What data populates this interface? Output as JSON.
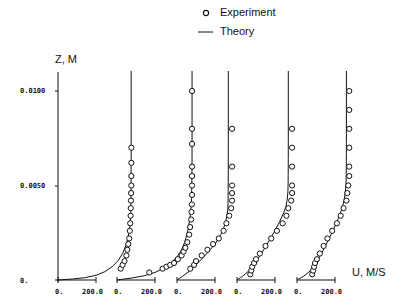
{
  "legend": {
    "experiment_label": "Experiment",
    "theory_label": "Theory"
  },
  "axes": {
    "y_label": "Z, M",
    "x_label": "U, M/S",
    "y_ticks": [
      "0.0100",
      "0.0050",
      "0."
    ],
    "x_tick_labels": [
      "0.",
      "200.0"
    ]
  },
  "chart_data": {
    "type": "line",
    "title": "",
    "xlabel": "U, M/S",
    "ylabel": "Z, M",
    "ylim": [
      0,
      0.01
    ],
    "y_ticks": [
      0,
      0.005,
      0.01
    ],
    "x_ticks_per_panel": [
      0,
      200
    ],
    "legend": [
      "Experiment (circles)",
      "Theory (line)"
    ],
    "grid": false,
    "panels": [
      {
        "name": "profile-1",
        "freestream_U": 385,
        "theory": [
          [
            0,
            0
          ],
          [
            150,
            0.0001
          ],
          [
            250,
            0.0004
          ],
          [
            320,
            0.001
          ],
          [
            360,
            0.0018
          ],
          [
            380,
            0.0028
          ],
          [
            385,
            0.004
          ],
          [
            385,
            0.01
          ]
        ],
        "experiment": [
          [
            330,
            0.0006
          ],
          [
            340,
            0.0008
          ],
          [
            350,
            0.001
          ],
          [
            360,
            0.0013
          ],
          [
            365,
            0.0016
          ],
          [
            370,
            0.0019
          ],
          [
            375,
            0.0022
          ],
          [
            378,
            0.0026
          ],
          [
            380,
            0.003
          ],
          [
            382,
            0.0034
          ],
          [
            383,
            0.0038
          ],
          [
            384,
            0.0042
          ],
          [
            385,
            0.0046
          ],
          [
            386,
            0.005
          ],
          [
            386,
            0.0055
          ],
          [
            386,
            0.0062
          ],
          [
            386,
            0.007
          ]
        ]
      },
      {
        "name": "profile-2",
        "freestream_U": 395,
        "theory": [
          [
            0,
            0
          ],
          [
            150,
            0.0002
          ],
          [
            250,
            0.0006
          ],
          [
            320,
            0.0012
          ],
          [
            360,
            0.002
          ],
          [
            385,
            0.0032
          ],
          [
            395,
            0.0045
          ],
          [
            395,
            0.01
          ]
        ],
        "experiment": [
          [
            170,
            0.0004
          ],
          [
            240,
            0.0006
          ],
          [
            260,
            0.0007
          ],
          [
            280,
            0.0008
          ],
          [
            300,
            0.0009
          ],
          [
            320,
            0.0011
          ],
          [
            340,
            0.0013
          ],
          [
            350,
            0.0015
          ],
          [
            360,
            0.0017
          ],
          [
            370,
            0.002
          ],
          [
            380,
            0.0024
          ],
          [
            385,
            0.0028
          ],
          [
            390,
            0.0032
          ],
          [
            392,
            0.0036
          ],
          [
            394,
            0.004
          ],
          [
            395,
            0.0045
          ],
          [
            395,
            0.005
          ],
          [
            395,
            0.0055
          ],
          [
            395,
            0.006
          ],
          [
            395,
            0.0072
          ],
          [
            395,
            0.008
          ],
          [
            395,
            0.01
          ]
        ]
      },
      {
        "name": "profile-3",
        "freestream_U": 270,
        "theory": [
          [
            0,
            0
          ],
          [
            60,
            0.0004
          ],
          [
            140,
            0.0012
          ],
          [
            210,
            0.002
          ],
          [
            250,
            0.0028
          ],
          [
            265,
            0.0035
          ],
          [
            270,
            0.004
          ],
          [
            270,
            0.01
          ]
        ],
        "experiment": [
          [
            70,
            0.0006
          ],
          [
            90,
            0.0008
          ],
          [
            100,
            0.001
          ],
          [
            130,
            0.0013
          ],
          [
            160,
            0.0016
          ],
          [
            190,
            0.0019
          ],
          [
            220,
            0.0022
          ],
          [
            245,
            0.0026
          ],
          [
            260,
            0.003
          ],
          [
            275,
            0.0034
          ],
          [
            285,
            0.0038
          ],
          [
            290,
            0.0042
          ],
          [
            290,
            0.0046
          ],
          [
            290,
            0.005
          ],
          [
            290,
            0.006
          ],
          [
            290,
            0.008
          ]
        ]
      },
      {
        "name": "profile-4",
        "freestream_U": 270,
        "theory": [
          [
            0,
            0
          ],
          [
            60,
            0.0004
          ],
          [
            130,
            0.0014
          ],
          [
            200,
            0.0026
          ],
          [
            250,
            0.0036
          ],
          [
            265,
            0.0042
          ],
          [
            270,
            0.005
          ],
          [
            270,
            0.01
          ]
        ],
        "experiment": [
          [
            70,
            0.0003
          ],
          [
            75,
            0.0005
          ],
          [
            80,
            0.0007
          ],
          [
            90,
            0.0009
          ],
          [
            100,
            0.0011
          ],
          [
            120,
            0.0014
          ],
          [
            150,
            0.0018
          ],
          [
            180,
            0.0022
          ],
          [
            210,
            0.0026
          ],
          [
            240,
            0.003
          ],
          [
            260,
            0.0034
          ],
          [
            270,
            0.0038
          ],
          [
            285,
            0.0042
          ],
          [
            290,
            0.0046
          ],
          [
            290,
            0.005
          ],
          [
            290,
            0.006
          ],
          [
            290,
            0.007
          ],
          [
            290,
            0.008
          ]
        ]
      },
      {
        "name": "profile-5",
        "freestream_U": 260,
        "theory": [
          [
            0,
            0
          ],
          [
            70,
            0.0004
          ],
          [
            130,
            0.0014
          ],
          [
            190,
            0.0026
          ],
          [
            240,
            0.0038
          ],
          [
            255,
            0.0046
          ],
          [
            260,
            0.0055
          ],
          [
            260,
            0.01
          ]
        ],
        "experiment": [
          [
            80,
            0.0003
          ],
          [
            85,
            0.0005
          ],
          [
            90,
            0.0007
          ],
          [
            95,
            0.0009
          ],
          [
            105,
            0.0011
          ],
          [
            120,
            0.0014
          ],
          [
            140,
            0.0018
          ],
          [
            160,
            0.0022
          ],
          [
            185,
            0.0026
          ],
          [
            210,
            0.003
          ],
          [
            230,
            0.0034
          ],
          [
            245,
            0.0038
          ],
          [
            260,
            0.0042
          ],
          [
            265,
            0.0046
          ],
          [
            270,
            0.005
          ],
          [
            275,
            0.0055
          ],
          [
            275,
            0.006
          ],
          [
            275,
            0.007
          ],
          [
            275,
            0.008
          ],
          [
            275,
            0.009
          ],
          [
            275,
            0.01
          ]
        ]
      }
    ]
  }
}
